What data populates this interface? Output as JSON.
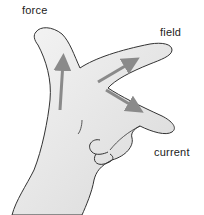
{
  "diagram": {
    "labels": {
      "force": "force",
      "field": "field",
      "current": "current"
    },
    "colors": {
      "background": "#ffffff",
      "skin": "#e9e9e9",
      "outline": "#333333",
      "arrow": "#8a8a8a"
    }
  }
}
